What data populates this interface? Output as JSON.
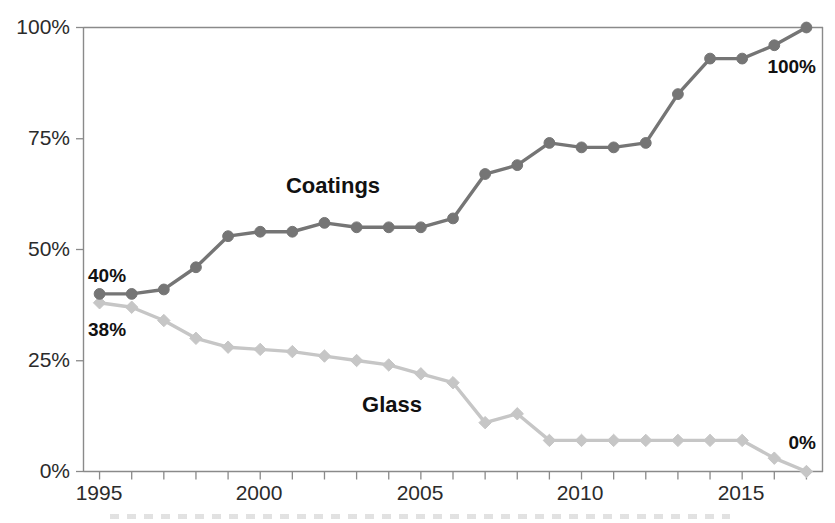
{
  "chart_data": {
    "type": "line",
    "title": "",
    "xlabel": "",
    "ylabel": "",
    "xlim": [
      1994.5,
      2017.5
    ],
    "ylim": [
      0,
      100
    ],
    "grid": false,
    "legend_position": "inline-labels",
    "y_tick_labels": [
      "100%",
      "75%",
      "50%",
      "25%",
      "0%"
    ],
    "y_tick_values": [
      100,
      75,
      50,
      25,
      0
    ],
    "x_tick_labels": [
      "1995",
      "2000",
      "2005",
      "2010",
      "2015"
    ],
    "x_tick_values": [
      1995,
      2000,
      2005,
      2010,
      2015
    ],
    "x_minor_ticks": [
      1995,
      1996,
      1997,
      1998,
      1999,
      2000,
      2001,
      2002,
      2003,
      2004,
      2005,
      2006,
      2007,
      2008,
      2009,
      2010,
      2011,
      2012,
      2013,
      2014,
      2015,
      2016,
      2017
    ],
    "x": [
      1995,
      1996,
      1997,
      1998,
      1999,
      2000,
      2001,
      2002,
      2003,
      2004,
      2005,
      2006,
      2007,
      2008,
      2009,
      2010,
      2011,
      2012,
      2013,
      2014,
      2015,
      2016,
      2017
    ],
    "series": [
      {
        "name": "Coatings",
        "color": "#757575",
        "marker": "circle",
        "values": [
          40,
          40,
          41,
          46,
          53,
          54,
          54,
          56,
          55,
          55,
          55,
          57,
          67,
          69,
          74,
          73,
          73,
          74,
          85,
          93,
          93,
          96,
          100
        ]
      },
      {
        "name": "Glass",
        "color": "#c6c6c6",
        "marker": "diamond",
        "values": [
          38,
          37,
          34,
          30,
          28,
          27.5,
          27,
          26,
          25,
          24,
          22,
          20,
          11,
          13,
          7,
          7,
          7,
          7,
          7,
          7,
          7,
          3,
          0
        ]
      }
    ],
    "annotations": [
      {
        "text": "40%",
        "series": "Coatings",
        "x": 1995,
        "y": 40,
        "position": "above-right"
      },
      {
        "text": "38%",
        "series": "Glass",
        "x": 1995,
        "y": 38,
        "position": "below-right"
      },
      {
        "text": "100%",
        "series": "Coatings",
        "x": 2017,
        "y": 100,
        "position": "below-left"
      },
      {
        "text": "0%",
        "series": "Glass",
        "x": 2017,
        "y": 0,
        "position": "above-left"
      }
    ],
    "series_labels": [
      {
        "text": "Coatings",
        "x": 2004,
        "y": 63
      },
      {
        "text": "Glass",
        "x": 2008.2,
        "y": 17
      }
    ]
  }
}
